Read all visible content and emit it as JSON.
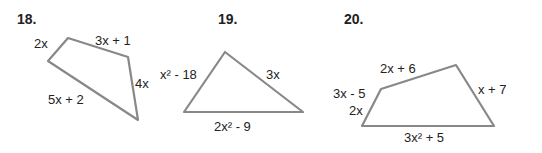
{
  "problems": [
    {
      "number": "18.",
      "shape": "quadrilateral",
      "sides": [
        "2x",
        "3x + 1",
        "4x",
        "5x + 2"
      ]
    },
    {
      "number": "19.",
      "shape": "triangle",
      "sides": [
        "x² - 18",
        "3x",
        "2x² - 9"
      ]
    },
    {
      "number": "20.",
      "shape": "pentagon",
      "sides": [
        "2x + 6",
        "3x - 5",
        "2x",
        "x + 7",
        "3x² + 5"
      ]
    }
  ],
  "colors": {
    "stroke": "#888888",
    "text": "#222222"
  }
}
